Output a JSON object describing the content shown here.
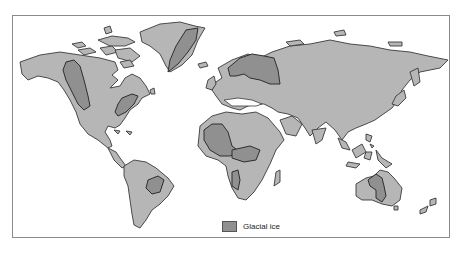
{
  "map": {
    "title": "",
    "description": "World map showing regions of glacial ice",
    "colors": {
      "background": "#ffffff",
      "land": "#b6b6b6",
      "glacial_ice": "#909090",
      "outline": "#3a3a3a",
      "frame": "#8a8a8a"
    },
    "glaciated_regions": [
      "Western North America (Cordillera)",
      "Eastern North America (Appalachians)",
      "Greenland",
      "Scandinavia",
      "Northwest Africa (Sahara)",
      "Central Africa",
      "Southern Africa",
      "Southeastern South America",
      "Central Australia"
    ]
  },
  "legend": {
    "items": [
      {
        "label": "Glacial ice",
        "color": "#909090"
      }
    ]
  }
}
